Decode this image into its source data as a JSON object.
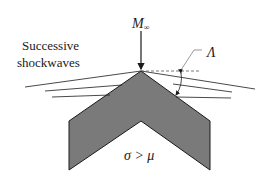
{
  "diagram": {
    "freestream_label": "M",
    "freestream_subscript": "∞",
    "shockwaves_label_line1": "Successive",
    "shockwaves_label_line2": "shockwaves",
    "angle_label": "Λ",
    "condition_label": "σ > μ",
    "colors": {
      "body_fill": "#7a7a7a",
      "body_stroke": "#1a1a1a",
      "line": "#1a1a1a",
      "dashed": "#555555"
    }
  }
}
